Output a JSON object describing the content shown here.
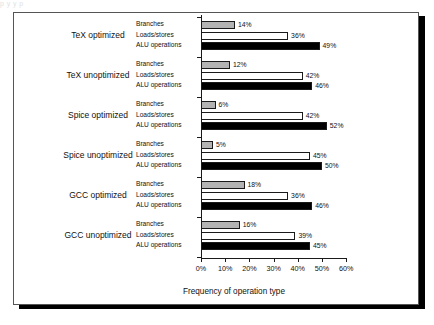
{
  "page": {
    "top_bleed_text": "p                                     y      y  p"
  },
  "chart_data": {
    "type": "bar",
    "orientation": "horizontal",
    "title": "",
    "xlabel": "Frequency of operation type",
    "ylabel": "",
    "xlim": [
      0,
      60
    ],
    "xtick_labels": [
      "0%",
      "10%",
      "20%",
      "30%",
      "40%",
      "50%",
      "60%"
    ],
    "xticks": [
      0,
      10,
      20,
      30,
      40,
      50,
      60
    ],
    "grid": false,
    "legend": "inline-labels",
    "series_names": [
      "Branches",
      "Loads/stores",
      "ALU operations"
    ],
    "series_colors": {
      "Branches": "#b3b3b3",
      "Loads/stores": "#ffffff",
      "ALU operations": "#000000"
    },
    "categories": [
      "TeX optimized",
      "TeX unoptimized",
      "Spice optimized",
      "Spice unoptimized",
      "GCC optimized",
      "GCC unoptimized"
    ],
    "series": [
      {
        "name": "Branches",
        "values": [
          14,
          12,
          6,
          5,
          18,
          16
        ]
      },
      {
        "name": "Loads/stores",
        "values": [
          36,
          42,
          42,
          45,
          36,
          39
        ]
      },
      {
        "name": "ALU operations",
        "values": [
          49,
          46,
          52,
          50,
          46,
          45
        ]
      }
    ],
    "groups": [
      {
        "category": "TeX optimized",
        "bars": [
          {
            "label": "Branches",
            "value": 14,
            "value_label": "14%"
          },
          {
            "label": "Loads/stores",
            "value": 36,
            "value_label": "36%"
          },
          {
            "label": "ALU operations",
            "value": 49,
            "value_label": "49%"
          }
        ]
      },
      {
        "category": "TeX unoptimized",
        "bars": [
          {
            "label": "Branches",
            "value": 12,
            "value_label": "12%"
          },
          {
            "label": "Loads/stores",
            "value": 42,
            "value_label": "42%"
          },
          {
            "label": "ALU operations",
            "value": 46,
            "value_label": "46%"
          }
        ]
      },
      {
        "category": "Spice optimized",
        "bars": [
          {
            "label": "Branches",
            "value": 6,
            "value_label": "6%"
          },
          {
            "label": "Loads/stores",
            "value": 42,
            "value_label": "42%"
          },
          {
            "label": "ALU operations",
            "value": 52,
            "value_label": "52%"
          }
        ]
      },
      {
        "category": "Spice unoptimized",
        "bars": [
          {
            "label": "Branches",
            "value": 5,
            "value_label": "5%"
          },
          {
            "label": "Loads/stores",
            "value": 45,
            "value_label": "45%"
          },
          {
            "label": "ALU operations",
            "value": 50,
            "value_label": "50%"
          }
        ]
      },
      {
        "category": "GCC optimized",
        "bars": [
          {
            "label": "Branches",
            "value": 18,
            "value_label": "18%"
          },
          {
            "label": "Loads/stores",
            "value": 36,
            "value_label": "36%"
          },
          {
            "label": "ALU operations",
            "value": 46,
            "value_label": "46%"
          }
        ]
      },
      {
        "category": "GCC unoptimized",
        "bars": [
          {
            "label": "Branches",
            "value": 16,
            "value_label": "16%"
          },
          {
            "label": "Loads/stores",
            "value": 39,
            "value_label": "39%"
          },
          {
            "label": "ALU operations",
            "value": 45,
            "value_label": "45%"
          }
        ]
      }
    ]
  }
}
